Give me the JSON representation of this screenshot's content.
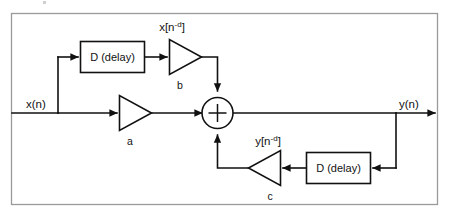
{
  "diagram": {
    "frame": {
      "name": "outer-border",
      "color": "#9a9a9a"
    },
    "line_color": "#111111",
    "background": "#ffffff",
    "signals": {
      "input": "x(n)",
      "output": "y(n)",
      "delayed_input_base": "x[n",
      "delayed_input_sup": "-d",
      "delayed_input_close": "]",
      "delayed_output_base": "y[n",
      "delayed_output_sup": "-d",
      "delayed_output_close": "]"
    },
    "blocks": [
      {
        "id": "delay-forward",
        "label": "D (delay)"
      },
      {
        "id": "delay-feedback",
        "label": "D (delay)"
      }
    ],
    "gains": [
      {
        "id": "gain-a",
        "label": "a",
        "direction": "right"
      },
      {
        "id": "gain-b",
        "label": "b",
        "direction": "right"
      },
      {
        "id": "gain-c",
        "label": "c",
        "direction": "left"
      }
    ],
    "adder": {
      "id": "summing-junction",
      "symbol": "+",
      "inputs": [
        "top",
        "left",
        "bottom"
      ],
      "outputs": [
        "right"
      ]
    }
  }
}
